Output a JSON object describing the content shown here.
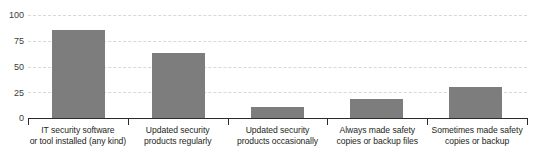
{
  "chart_data": {
    "type": "bar",
    "title": "",
    "subtitle": "",
    "xlabel": "",
    "ylabel": "",
    "ylim": [
      0,
      100
    ],
    "grid": true,
    "legend": false,
    "orientation": "vertical",
    "bar_color": "#7d7d7d",
    "background_color": "#ffffff",
    "gridline_color": "#d8d8d8",
    "axis_color": "#2b2b2b",
    "yticks": [
      0,
      25,
      50,
      75,
      100
    ],
    "ytick_labels": [
      "0",
      "25",
      "50",
      "75",
      "100"
    ],
    "categories": [
      "IT security software or tool installed (any kind)",
      "Updated security products regularly",
      "Updated security products occasionally",
      "Always made safety copies or backup files",
      "Sometimes made safety copies or backup"
    ],
    "category_lines": [
      [
        "IT security software",
        "or tool installed (any kind)"
      ],
      [
        "Updated security",
        "products regularly"
      ],
      [
        "Updated security",
        "products occasionally"
      ],
      [
        "Always made safety",
        "copies or backup files"
      ],
      [
        "Sometimes made safety",
        "copies or backup"
      ]
    ],
    "values": [
      85,
      63,
      11,
      18,
      30
    ]
  }
}
